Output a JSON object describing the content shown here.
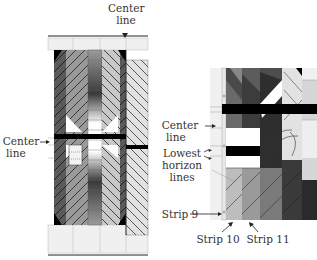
{
  "left_panel": {
    "labels": {
      "top_center": "Center\nline",
      "top_center_l1": "Center",
      "top_center_l2": "line",
      "left_center_l1": "Center",
      "left_center_l2": "line"
    }
  },
  "right_panel": {
    "labels": {
      "center_l1": "Center",
      "center_l2": "line",
      "lowest_l1": "Lowest",
      "lowest_l2": "horizon",
      "lowest_l3": "lines",
      "strip9": "Strip 9",
      "strip10": "Strip 10",
      "strip11": "Strip 11"
    }
  },
  "colors": {
    "black": "#000000",
    "dark": "#3a3a3a",
    "mid": "#7a7a7a",
    "light": "#bdbdbd",
    "pale": "#e6e6e6",
    "white": "#ffffff"
  }
}
